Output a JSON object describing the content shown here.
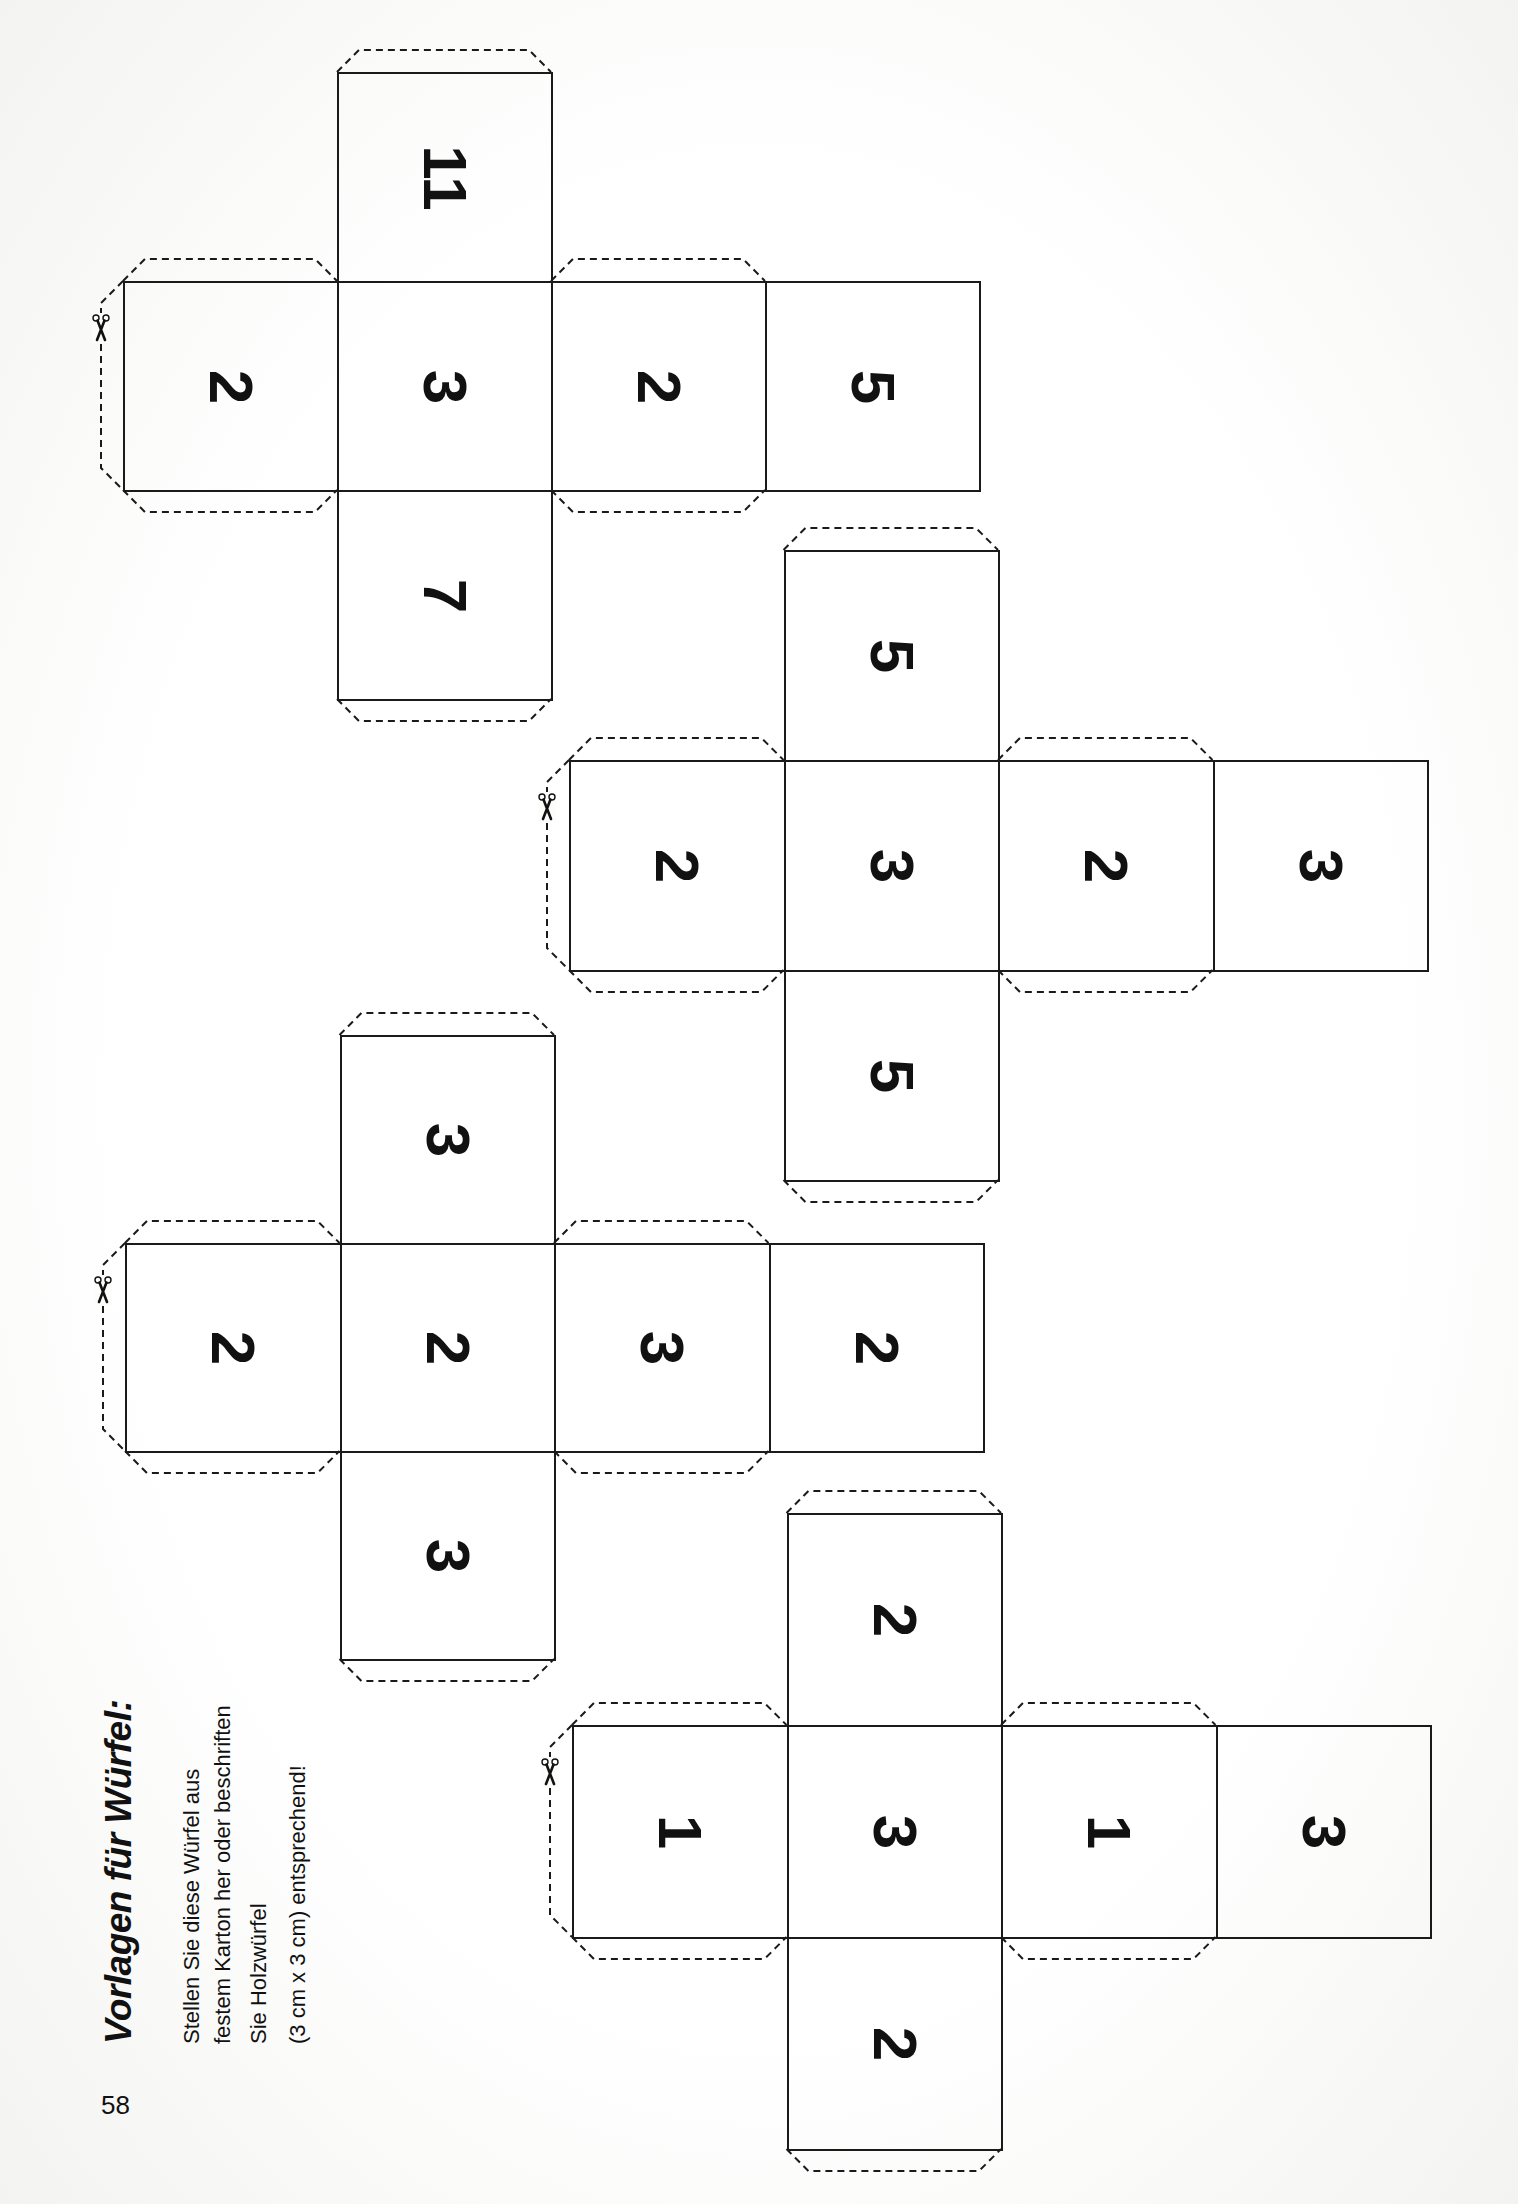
{
  "page": {
    "number": "58",
    "title": "Vorlagen für Würfel:",
    "instructions": [
      "Stellen Sie diese Würfel aus",
      "festem Karton her oder beschriften",
      "Sie Holzwürfel",
      "(3 cm x 3 cm) entsprechend!"
    ]
  },
  "icons": {
    "cut_marker": "scissors-icon"
  },
  "colors": {
    "line": "#1a1a1a",
    "paper": "#fcfcfb",
    "text": "#111111"
  },
  "nets": [
    {
      "name": "die-net-1",
      "origin": [
        123,
        281
      ],
      "sx": 214,
      "sy": 209,
      "top": "11",
      "row": [
        "2",
        "3",
        "2",
        "5"
      ],
      "bottom": "7"
    },
    {
      "name": "die-net-2",
      "origin": [
        569,
        760
      ],
      "sx": 214.5,
      "sy": 210,
      "top": "5",
      "row": [
        "2",
        "3",
        "2",
        "3"
      ],
      "bottom": "5"
    },
    {
      "name": "die-net-3",
      "origin": [
        125,
        1243
      ],
      "sx": 214.5,
      "sy": 208,
      "top": "3",
      "row": [
        "2",
        "2",
        "3",
        "2"
      ],
      "bottom": "3"
    },
    {
      "name": "die-net-4",
      "origin": [
        572,
        1725
      ],
      "sx": 214.5,
      "sy": 212,
      "top": "2",
      "row": [
        "1",
        "3",
        "1",
        "3"
      ],
      "bottom": "2"
    }
  ]
}
